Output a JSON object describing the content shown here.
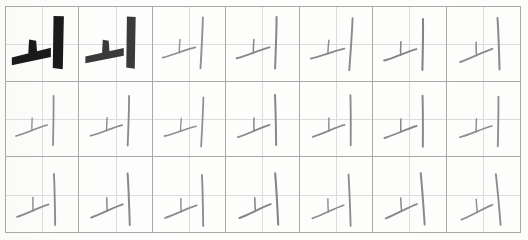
{
  "sheet": {
    "title": "Korean handwriting practice sheet",
    "target_character": "ㅚ",
    "character_romanization": "oe",
    "grid_columns": 7,
    "grid_rows": 3,
    "total_cells": 21,
    "background_color": "#fdfdfc",
    "border_color": "#a9a9a9",
    "guide_line_color": "#dcdcdc",
    "model_ink_color": "#1c1c1c",
    "traced_ink_color": "#4a4a4a",
    "pencil_ink_color": "#8d8d93"
  },
  "cells": [
    {
      "row": 1,
      "col": 1,
      "character": "ㅚ",
      "style": "printed-model",
      "ink": "#1a1a1a",
      "stroke_weight": 7.5,
      "slant": 0,
      "scale": 1.0,
      "offset_x": 0,
      "offset_y": 0
    },
    {
      "row": 1,
      "col": 2,
      "character": "ㅚ",
      "style": "printed-model-faded",
      "ink": "#3a3a3a",
      "stroke_weight": 6.5,
      "slant": 0,
      "scale": 0.98,
      "offset_x": 0,
      "offset_y": 0
    },
    {
      "row": 1,
      "col": 3,
      "character": "ㅚ",
      "style": "pencil",
      "ink": "#8f8f95",
      "stroke_weight": 2.2,
      "slant": -2,
      "scale": 0.95,
      "offset_x": -1,
      "offset_y": -2
    },
    {
      "row": 1,
      "col": 4,
      "character": "ㅚ",
      "style": "pencil",
      "ink": "#86868c",
      "stroke_weight": 2.3,
      "slant": -3,
      "scale": 0.96,
      "offset_x": 0,
      "offset_y": -2
    },
    {
      "row": 1,
      "col": 5,
      "character": "ㅚ",
      "style": "pencil",
      "ink": "#8a8a90",
      "stroke_weight": 2.2,
      "slant": -1,
      "scale": 0.97,
      "offset_x": 1,
      "offset_y": -1
    },
    {
      "row": 1,
      "col": 6,
      "character": "ㅚ",
      "style": "pencil",
      "ink": "#84848a",
      "stroke_weight": 2.4,
      "slant": -4,
      "scale": 0.95,
      "offset_x": 0,
      "offset_y": 0
    },
    {
      "row": 1,
      "col": 7,
      "character": "ㅚ",
      "style": "pencil",
      "ink": "#8b8b91",
      "stroke_weight": 2.3,
      "slant": -7,
      "scale": 0.96,
      "offset_x": 1,
      "offset_y": 0
    },
    {
      "row": 2,
      "col": 1,
      "character": "ㅚ",
      "style": "pencil",
      "ink": "#8c8c92",
      "stroke_weight": 2.1,
      "slant": -4,
      "scale": 0.92,
      "offset_x": -2,
      "offset_y": 1
    },
    {
      "row": 2,
      "col": 2,
      "character": "ㅚ",
      "style": "pencil",
      "ink": "#89898f",
      "stroke_weight": 2.2,
      "slant": -3,
      "scale": 0.93,
      "offset_x": 0,
      "offset_y": 1
    },
    {
      "row": 2,
      "col": 3,
      "character": "ㅚ",
      "style": "pencil",
      "ink": "#8e8e94",
      "stroke_weight": 2.1,
      "slant": -2,
      "scale": 0.92,
      "offset_x": 0,
      "offset_y": 2
    },
    {
      "row": 2,
      "col": 4,
      "character": "ㅚ",
      "style": "pencil",
      "ink": "#85858b",
      "stroke_weight": 2.3,
      "slant": -6,
      "scale": 0.94,
      "offset_x": 0,
      "offset_y": 1
    },
    {
      "row": 2,
      "col": 5,
      "character": "ㅚ",
      "style": "pencil",
      "ink": "#8b8b91",
      "stroke_weight": 2.2,
      "slant": -5,
      "scale": 0.94,
      "offset_x": 1,
      "offset_y": 1
    },
    {
      "row": 2,
      "col": 6,
      "character": "ㅚ",
      "style": "pencil",
      "ink": "#87878d",
      "stroke_weight": 2.3,
      "slant": -5,
      "scale": 0.95,
      "offset_x": 0,
      "offset_y": 2
    },
    {
      "row": 2,
      "col": 7,
      "character": "ㅚ",
      "style": "pencil",
      "ink": "#8d8d93",
      "stroke_weight": 2.2,
      "slant": -4,
      "scale": 0.93,
      "offset_x": 1,
      "offset_y": 2
    },
    {
      "row": 3,
      "col": 1,
      "character": "ㅚ",
      "style": "pencil",
      "ink": "#8a8a90",
      "stroke_weight": 2.2,
      "slant": -6,
      "scale": 0.94,
      "offset_x": -1,
      "offset_y": 5
    },
    {
      "row": 3,
      "col": 2,
      "character": "ㅚ",
      "style": "pencil",
      "ink": "#87878d",
      "stroke_weight": 2.3,
      "slant": -7,
      "scale": 0.95,
      "offset_x": 0,
      "offset_y": 5
    },
    {
      "row": 3,
      "col": 3,
      "character": "ㅚ",
      "style": "pencil",
      "ink": "#8c8c92",
      "stroke_weight": 2.2,
      "slant": -6,
      "scale": 0.94,
      "offset_x": 0,
      "offset_y": 6
    },
    {
      "row": 3,
      "col": 4,
      "character": "ㅚ",
      "style": "pencil",
      "ink": "#84848a",
      "stroke_weight": 2.4,
      "slant": -8,
      "scale": 0.95,
      "offset_x": 1,
      "offset_y": 5
    },
    {
      "row": 3,
      "col": 5,
      "character": "ㅚ",
      "style": "pencil",
      "ink": "#8b8b91",
      "stroke_weight": 2.2,
      "slant": -7,
      "scale": 0.94,
      "offset_x": 0,
      "offset_y": 6
    },
    {
      "row": 3,
      "col": 6,
      "character": "ㅚ",
      "style": "pencil",
      "ink": "#88888e",
      "stroke_weight": 2.3,
      "slant": -9,
      "scale": 0.95,
      "offset_x": 0,
      "offset_y": 5
    },
    {
      "row": 3,
      "col": 7,
      "character": "ㅚ",
      "style": "pencil",
      "ink": "#8d8d93",
      "stroke_weight": 2.2,
      "slant": -10,
      "scale": 0.94,
      "offset_x": 1,
      "offset_y": 6
    }
  ]
}
